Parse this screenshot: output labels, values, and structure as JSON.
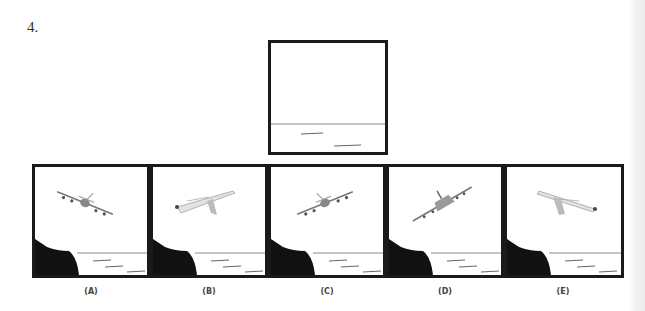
{
  "question": {
    "number": "4."
  },
  "question_figure": {
    "description": "empty sea scene with horizon line and water ripples"
  },
  "options": [
    {
      "label": "(A)",
      "plane_view": "front view, banking left-down"
    },
    {
      "label": "(B)",
      "plane_view": "side view, nose left"
    },
    {
      "label": "(C)",
      "plane_view": "front view, banking right-down"
    },
    {
      "label": "(D)",
      "plane_view": "rear view, banking"
    },
    {
      "label": "(E)",
      "plane_view": "side view, nose right"
    }
  ],
  "colors": {
    "frame": "#1a1a1a",
    "cliff": "#111111",
    "horizon": "#888888",
    "plane": "#8a8a8a"
  }
}
